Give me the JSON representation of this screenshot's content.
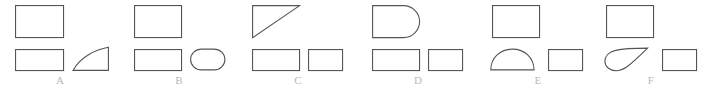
{
  "figure": {
    "width": 704,
    "height": 90,
    "background_color": "#ffffff",
    "stroke_color": "#555555",
    "label_color": "#b9b9b9",
    "stroke_width": 1.1
  },
  "groups": [
    {
      "id": "a",
      "label": "A",
      "top_row": [
        {
          "name": "rectangle",
          "icon": "rectangle-shape",
          "width": 48,
          "height": 32
        }
      ],
      "bottom_row": [
        {
          "name": "rectangle",
          "icon": "rectangle-shape",
          "width": 48,
          "height": 21
        },
        {
          "name": "curved-right-triangle",
          "icon": "curved-triangle-shape",
          "width": 37,
          "height": 24
        }
      ]
    },
    {
      "id": "b",
      "label": "B",
      "top_row": [
        {
          "name": "rectangle",
          "icon": "rectangle-shape",
          "width": 47,
          "height": 32
        }
      ],
      "bottom_row": [
        {
          "name": "rectangle",
          "icon": "rectangle-shape",
          "width": 47,
          "height": 21
        },
        {
          "name": "stadium-oval",
          "icon": "stadium-shape",
          "width": 35,
          "height": 22
        }
      ]
    },
    {
      "id": "c",
      "label": "C",
      "top_row": [
        {
          "name": "right-triangle",
          "icon": "right-triangle-shape",
          "width": 47,
          "height": 32
        }
      ],
      "bottom_row": [
        {
          "name": "rectangle",
          "icon": "rectangle-shape",
          "width": 47,
          "height": 21
        },
        {
          "name": "rectangle",
          "icon": "rectangle-shape",
          "width": 34,
          "height": 21
        }
      ]
    },
    {
      "id": "d",
      "label": "D",
      "top_row": [
        {
          "name": "d-shape-rounded-end",
          "icon": "d-shape",
          "width": 47,
          "height": 32
        }
      ],
      "bottom_row": [
        {
          "name": "rectangle",
          "icon": "rectangle-shape",
          "width": 47,
          "height": 21
        },
        {
          "name": "rectangle",
          "icon": "rectangle-shape",
          "width": 34,
          "height": 21
        }
      ]
    },
    {
      "id": "e",
      "label": "E",
      "top_row": [
        {
          "name": "rectangle",
          "icon": "rectangle-shape",
          "width": 47,
          "height": 32
        }
      ],
      "bottom_row": [
        {
          "name": "semicircle-dome",
          "icon": "semicircle-shape",
          "width": 44,
          "height": 22
        },
        {
          "name": "rectangle",
          "icon": "rectangle-shape",
          "width": 34,
          "height": 21
        }
      ]
    },
    {
      "id": "f",
      "label": "F",
      "top_row": [
        {
          "name": "rectangle",
          "icon": "rectangle-shape",
          "width": 47,
          "height": 32
        }
      ],
      "bottom_row": [
        {
          "name": "teardrop",
          "icon": "teardrop-shape",
          "width": 44,
          "height": 22
        },
        {
          "name": "rectangle",
          "icon": "rectangle-shape",
          "width": 34,
          "height": 21
        }
      ]
    }
  ]
}
